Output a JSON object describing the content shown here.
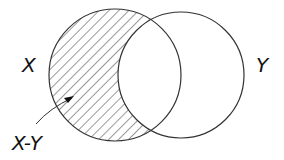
{
  "diagram": {
    "type": "venn",
    "sets": [
      {
        "id": "X",
        "label": "X"
      },
      {
        "id": "Y",
        "label": "Y"
      }
    ],
    "shaded_region": {
      "label": "X-Y",
      "description": "elements of X not in Y",
      "pattern": "diagonal-hatch"
    },
    "colors": {
      "stroke": "#333333",
      "hatch": "#333333",
      "background": "#ffffff",
      "text": "#111111"
    }
  }
}
